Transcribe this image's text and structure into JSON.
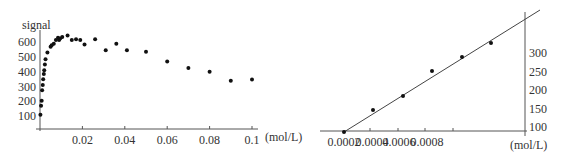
{
  "chart_data": [
    {
      "type": "scatter",
      "title": "",
      "ylabel": "signal",
      "xlabel": "(mol/L)",
      "xlim": [
        0,
        0.1
      ],
      "ylim": [
        0,
        650
      ],
      "xticks": [
        "0.02",
        "0.04",
        "0.06",
        "0.08",
        "0.1"
      ],
      "yticks": [
        "100",
        "200",
        "300",
        "400",
        "500",
        "600"
      ],
      "grid": false,
      "points": [
        {
          "x": 0.0002,
          "y": 110
        },
        {
          "x": 0.0005,
          "y": 170
        },
        {
          "x": 0.0008,
          "y": 205
        },
        {
          "x": 0.001,
          "y": 275
        },
        {
          "x": 0.0013,
          "y": 310
        },
        {
          "x": 0.0015,
          "y": 350
        },
        {
          "x": 0.0018,
          "y": 385
        },
        {
          "x": 0.002,
          "y": 410
        },
        {
          "x": 0.0023,
          "y": 450
        },
        {
          "x": 0.0026,
          "y": 485
        },
        {
          "x": 0.0035,
          "y": 530
        },
        {
          "x": 0.005,
          "y": 570
        },
        {
          "x": 0.0055,
          "y": 580
        },
        {
          "x": 0.0065,
          "y": 590
        },
        {
          "x": 0.0075,
          "y": 615
        },
        {
          "x": 0.0085,
          "y": 630
        },
        {
          "x": 0.009,
          "y": 615
        },
        {
          "x": 0.0095,
          "y": 625
        },
        {
          "x": 0.0105,
          "y": 635
        },
        {
          "x": 0.013,
          "y": 645
        },
        {
          "x": 0.015,
          "y": 615
        },
        {
          "x": 0.017,
          "y": 620
        },
        {
          "x": 0.019,
          "y": 615
        },
        {
          "x": 0.021,
          "y": 585
        },
        {
          "x": 0.026,
          "y": 620
        },
        {
          "x": 0.031,
          "y": 545
        },
        {
          "x": 0.036,
          "y": 590
        },
        {
          "x": 0.041,
          "y": 545
        },
        {
          "x": 0.05,
          "y": 535
        },
        {
          "x": 0.06,
          "y": 470
        },
        {
          "x": 0.07,
          "y": 425
        },
        {
          "x": 0.08,
          "y": 400
        },
        {
          "x": 0.09,
          "y": 340
        },
        {
          "x": 0.1,
          "y": 348
        }
      ]
    },
    {
      "type": "scatter",
      "title": "",
      "ylabel": "",
      "xlabel": "(mol/L)",
      "xlim": [
        0.0002,
        0.0011
      ],
      "ylim": [
        100,
        330
      ],
      "xticks": [
        "0.0002",
        "0.0004",
        "0.0006",
        "0.0008"
      ],
      "yticks": [
        "100",
        "150",
        "200",
        "250",
        "300"
      ],
      "yaxis_position": "right",
      "grid": false,
      "trendline": true,
      "points": [
        {
          "x": 0.0002,
          "y": 100
        },
        {
          "x": 0.0004,
          "y": 160
        },
        {
          "x": 0.0006,
          "y": 195
        },
        {
          "x": 0.0007,
          "y": 240
        },
        {
          "x": 0.0008,
          "y": 290
        },
        {
          "x": 0.0009,
          "y": 325
        }
      ]
    }
  ],
  "labels": {
    "left_ylabel": "signal",
    "left_xunit": "(mol/L)",
    "right_xunit": "(mol/L)"
  }
}
